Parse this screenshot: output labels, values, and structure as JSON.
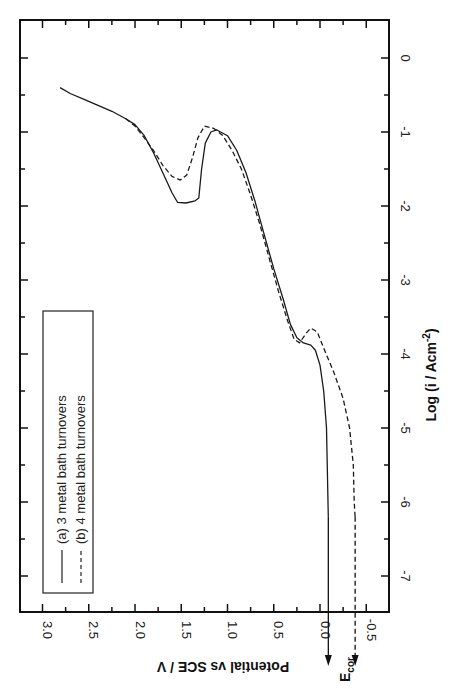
{
  "chart_data": {
    "type": "line",
    "orientation": "rotated-90-clockwise",
    "title": "",
    "xlabel": "Potential vs SCE / V",
    "ylabel": "Log (i / Acm^-2)",
    "ylabel_main": "Log (i / Acm",
    "ylabel_sup": "-2",
    "ylabel_end": ")",
    "xlim": [
      3.3,
      -0.8
    ],
    "ylim": [
      -7.5,
      0.5
    ],
    "x_ticks": [
      "3.0",
      "2.5",
      "2.0",
      "1.5",
      "1.0",
      "0.5",
      "0.0",
      "-0.5"
    ],
    "x_tick_values": [
      3.0,
      2.5,
      2.0,
      1.5,
      1.0,
      0.5,
      0.0,
      -0.5
    ],
    "y_ticks": [
      "0",
      "-1",
      "-2",
      "-3",
      "-4",
      "-5",
      "-6",
      "-7"
    ],
    "y_tick_values": [
      0,
      -1,
      -2,
      -3,
      -4,
      -5,
      -6,
      -7
    ],
    "grid": false,
    "legend_position": "lower-left (rotated)",
    "annotations": [
      {
        "text": "E",
        "sub": "cor",
        "note": "arrows mark corrosion potentials of both curves"
      }
    ],
    "series": [
      {
        "name": "(a) 3 metal bath turnovers",
        "style": "solid",
        "points": [
          [
            2.81,
            -0.4
          ],
          [
            2.7,
            -0.48
          ],
          [
            2.55,
            -0.56
          ],
          [
            2.4,
            -0.64
          ],
          [
            2.25,
            -0.72
          ],
          [
            2.1,
            -0.82
          ],
          [
            2.0,
            -0.9
          ],
          [
            1.9,
            -1.05
          ],
          [
            1.8,
            -1.28
          ],
          [
            1.7,
            -1.55
          ],
          [
            1.6,
            -1.82
          ],
          [
            1.54,
            -1.95
          ],
          [
            1.45,
            -1.96
          ],
          [
            1.35,
            -1.93
          ],
          [
            1.31,
            -1.89
          ],
          [
            1.28,
            -1.5
          ],
          [
            1.24,
            -1.15
          ],
          [
            1.18,
            -1.0
          ],
          [
            1.12,
            -0.97
          ],
          [
            1.0,
            -1.05
          ],
          [
            0.9,
            -1.25
          ],
          [
            0.8,
            -1.55
          ],
          [
            0.7,
            -1.95
          ],
          [
            0.6,
            -2.4
          ],
          [
            0.5,
            -2.85
          ],
          [
            0.4,
            -3.25
          ],
          [
            0.32,
            -3.6
          ],
          [
            0.25,
            -3.78
          ],
          [
            0.18,
            -3.85
          ],
          [
            0.1,
            -3.88
          ],
          [
            0.05,
            -3.95
          ],
          [
            0.0,
            -4.15
          ],
          [
            -0.04,
            -4.5
          ],
          [
            -0.07,
            -5.0
          ],
          [
            -0.08,
            -5.6
          ],
          [
            -0.09,
            -6.2
          ]
        ]
      },
      {
        "name": "(b) 4 metal bath turnovers",
        "style": "dashed",
        "points": [
          [
            2.1,
            -0.82
          ],
          [
            2.0,
            -0.92
          ],
          [
            1.9,
            -1.08
          ],
          [
            1.8,
            -1.25
          ],
          [
            1.7,
            -1.45
          ],
          [
            1.6,
            -1.6
          ],
          [
            1.51,
            -1.65
          ],
          [
            1.44,
            -1.58
          ],
          [
            1.38,
            -1.35
          ],
          [
            1.32,
            -1.08
          ],
          [
            1.25,
            -0.92
          ],
          [
            1.15,
            -0.95
          ],
          [
            1.05,
            -1.05
          ],
          [
            0.95,
            -1.25
          ],
          [
            0.85,
            -1.5
          ],
          [
            0.75,
            -1.85
          ],
          [
            0.65,
            -2.25
          ],
          [
            0.55,
            -2.7
          ],
          [
            0.45,
            -3.15
          ],
          [
            0.35,
            -3.55
          ],
          [
            0.28,
            -3.8
          ],
          [
            0.22,
            -3.85
          ],
          [
            0.15,
            -3.72
          ],
          [
            0.1,
            -3.65
          ],
          [
            0.03,
            -3.7
          ],
          [
            -0.05,
            -3.95
          ],
          [
            -0.15,
            -4.25
          ],
          [
            -0.25,
            -4.6
          ],
          [
            -0.32,
            -5.0
          ],
          [
            -0.36,
            -5.5
          ],
          [
            -0.37,
            -6.0
          ],
          [
            -0.38,
            -6.2
          ]
        ]
      }
    ],
    "ecor": [
      {
        "series": "(a)",
        "potential": -0.09,
        "style": "solid"
      },
      {
        "series": "(b)",
        "potential": -0.38,
        "style": "dashed"
      }
    ]
  },
  "legend": {
    "items": [
      {
        "label": "(a) 3 metal bath turnovers",
        "style": "solid"
      },
      {
        "label": "(b) 4 metal bath turnovers",
        "style": "dashed"
      }
    ]
  },
  "ecor_label": {
    "main": "E",
    "sub": "cor"
  },
  "colors": {
    "line": "#1a1a1a",
    "axis": "#111111",
    "background": "#ffffff"
  }
}
